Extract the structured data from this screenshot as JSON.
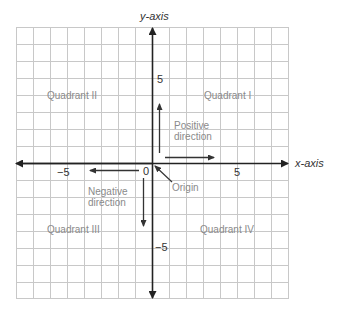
{
  "diagram": {
    "axes": {
      "x_label": "x-axis",
      "y_label": "y-axis"
    },
    "ticks": {
      "x_positive": "5",
      "x_negative": "−5",
      "y_positive": "5",
      "y_negative": "−5",
      "origin": "0"
    },
    "quadrants": {
      "q1": "Quadrant I",
      "q2": "Quadrant II",
      "q3": "Quadrant III",
      "q4": "Quadrant IV"
    },
    "annotations": {
      "positive_line1": "Positive",
      "positive_line2": "direction",
      "negative_line1": "Negative",
      "negative_line2": "direction",
      "origin_label": "Origin"
    },
    "grid": {
      "columns": 16,
      "rows": 16,
      "range": [
        -8,
        8
      ]
    },
    "colors": {
      "grid": "#c8c8c8",
      "axis": "#222222",
      "label_gray": "#8a8a8a"
    }
  }
}
